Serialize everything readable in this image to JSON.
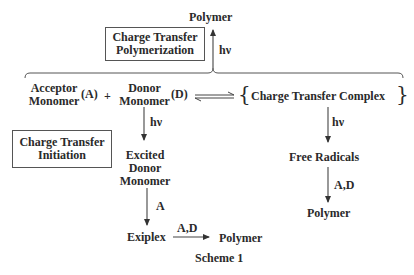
{
  "diagram": {
    "caption": "Scheme 1",
    "boxes": {
      "polymerization": {
        "line1": "Charge Transfer",
        "line2": "Polymerization"
      },
      "initiation": {
        "line1": "Charge Transfer",
        "line2": "Initiation"
      }
    },
    "nodes": {
      "top_polymer": "Polymer",
      "acceptor_line1": "Acceptor",
      "acceptor_line2": "Monomer",
      "acceptor_symbol": "(A)",
      "plus": "+",
      "donor_line1": "Donor",
      "donor_line2": "Monomer",
      "donor_symbol": "(D)",
      "ct_complex": "Charge Transfer Complex",
      "brace_open": "{",
      "brace_close": "}",
      "excited_line1": "Excited",
      "excited_line2": "Donor",
      "excited_line3": "Monomer",
      "exiplex": "Exiplex",
      "exiplex_polymer": "Polymer",
      "free_radicals": "Free Radicals",
      "radical_polymer": "Polymer"
    },
    "arrow_labels": {
      "top_hv": "hν",
      "donor_hv": "hν",
      "complex_hv": "hν",
      "excited_to_exiplex": "A",
      "exiplex_to_polymer": "A,D",
      "radicals_to_polymer": "A,D"
    },
    "colors": {
      "ink": "#2a2a2a",
      "line": "#444444",
      "background": "#ffffff"
    }
  }
}
